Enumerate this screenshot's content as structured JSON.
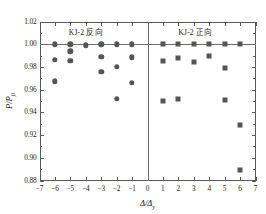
{
  "chart_data": {
    "type": "scatter",
    "title": "",
    "xlabel": "Δ/Δy",
    "ylabel": "P/Pjl",
    "xlim": [
      -7,
      7
    ],
    "ylim": [
      0.88,
      1.02
    ],
    "xticks": [
      "−7",
      "−6",
      "−5",
      "−4",
      "−3",
      "−2",
      "−1",
      "0",
      "1",
      "2",
      "3",
      "4",
      "5",
      "6",
      "7"
    ],
    "xtick_values": [
      -7,
      -6,
      -5,
      -4,
      -3,
      -2,
      -1,
      0,
      1,
      2,
      3,
      4,
      5,
      6,
      7
    ],
    "yticks": [
      "0.88",
      "0.90",
      "0.92",
      "0.94",
      "0.96",
      "0.98",
      "1.00",
      "1.02"
    ],
    "ytick_values": [
      0.88,
      0.9,
      0.92,
      0.94,
      0.96,
      0.98,
      1.0,
      1.02
    ],
    "grid": false,
    "legend": "none",
    "annotations": [
      {
        "text": "KJ-2    反向",
        "x": -4.0,
        "y": 1.0115,
        "name": "annotation-reverse"
      },
      {
        "text": "KJ-2    正向",
        "x": 3.1,
        "y": 1.0115,
        "name": "annotation-forward"
      }
    ],
    "reference_lines": [
      {
        "orientation": "horizontal",
        "value": 1.0,
        "name": "reference-line-unity"
      },
      {
        "orientation": "vertical",
        "value": 0.0,
        "name": "divider-line-zero"
      }
    ],
    "series": [
      {
        "name": "KJ-2 反向",
        "marker": "circle",
        "color": "#555558",
        "points": [
          {
            "x": -6,
            "y": 1.0
          },
          {
            "x": -6,
            "y": 0.9862
          },
          {
            "x": -6,
            "y": 0.9675
          },
          {
            "x": -5,
            "y": 1.0
          },
          {
            "x": -5,
            "y": 0.9938
          },
          {
            "x": -5,
            "y": 0.9852
          },
          {
            "x": -4,
            "y": 0.999
          },
          {
            "x": -3,
            "y": 1.0
          },
          {
            "x": -3,
            "y": 0.9888
          },
          {
            "x": -3,
            "y": 0.9758
          },
          {
            "x": -2,
            "y": 1.0
          },
          {
            "x": -2,
            "y": 0.9802
          },
          {
            "x": -2,
            "y": 0.9518
          },
          {
            "x": -1,
            "y": 1.0
          },
          {
            "x": -1,
            "y": 0.9885
          },
          {
            "x": -1,
            "y": 0.966
          }
        ]
      },
      {
        "name": "KJ-2 正向",
        "marker": "square",
        "color": "#555558",
        "points": [
          {
            "x": 1,
            "y": 1.0
          },
          {
            "x": 1,
            "y": 0.9848
          },
          {
            "x": 1,
            "y": 0.95
          },
          {
            "x": 2,
            "y": 1.0
          },
          {
            "x": 2,
            "y": 0.9882
          },
          {
            "x": 2,
            "y": 0.9522
          },
          {
            "x": 3,
            "y": 1.0
          },
          {
            "x": 3,
            "y": 0.984
          },
          {
            "x": 4,
            "y": 1.0
          },
          {
            "x": 4,
            "y": 0.9898
          },
          {
            "x": 5,
            "y": 1.0
          },
          {
            "x": 5,
            "y": 0.979
          },
          {
            "x": 5,
            "y": 0.9505
          },
          {
            "x": 6,
            "y": 1.0
          },
          {
            "x": 6,
            "y": 0.9285
          },
          {
            "x": 6,
            "y": 0.889
          }
        ]
      }
    ]
  }
}
